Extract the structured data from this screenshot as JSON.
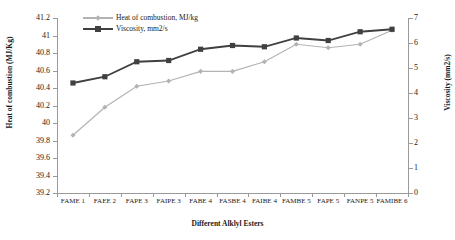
{
  "chart_data": {
    "type": "line",
    "title": "",
    "xlabel": "Different Alklyl Esters",
    "ylabel": "Heat of combustion (MJ/Kg)",
    "y2label": "Viscosity (mm2/s)",
    "categories": [
      "FAME 1",
      "FAEE 2",
      "FAPE 3",
      "FAIPE 3",
      "FABE 4",
      "FASBE 4",
      "FAIBE 4",
      "FAMBE 5",
      "FAPE 5",
      "FANPE 5",
      "FAMIBE 6"
    ],
    "ylim": [
      39.2,
      41.2
    ],
    "yticks": [
      "39.2",
      "39.4",
      "39.6",
      "39.8",
      "40",
      "40.2",
      "40.4",
      "40.6",
      "40.8",
      "41",
      "41.2"
    ],
    "y2lim": [
      0,
      7
    ],
    "y2ticks": [
      "0",
      "1",
      "2",
      "3",
      "4",
      "5",
      "6",
      "7"
    ],
    "grid": false,
    "legend_position": "top-left",
    "series": [
      {
        "name": "Heat of combustion, MJ/kg",
        "axis": "left",
        "color": "#b3b3b3",
        "marker": "diamond",
        "values": [
          39.86,
          40.18,
          40.42,
          40.48,
          40.59,
          40.59,
          40.7,
          40.9,
          40.86,
          40.9,
          41.06
        ]
      },
      {
        "name": "Viscosity, mm2/s",
        "axis": "right",
        "color": "#404040",
        "marker": "square",
        "values": [
          4.4,
          4.65,
          5.25,
          5.3,
          5.75,
          5.9,
          5.85,
          6.2,
          6.1,
          6.45,
          6.55
        ]
      }
    ]
  },
  "legend": {
    "items": [
      {
        "label": "Heat of combustion, MJ/kg",
        "color": "#b3b3b3"
      },
      {
        "label": "Viscosity, mm2/s",
        "color": "#404040"
      }
    ]
  },
  "axes": {
    "left_title": "Heat of combustion (MJ/Kg)",
    "right_title": "Viscosity (mm2/s)",
    "x_title": "Different Alklyl Esters"
  }
}
